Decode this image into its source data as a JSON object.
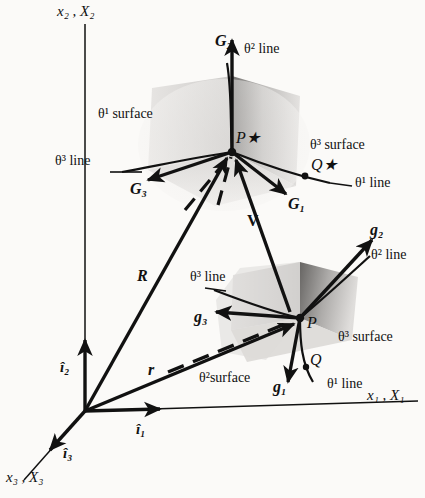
{
  "figure": {
    "background_color": "#fbfaf8",
    "ink_color": "#111111",
    "surface_fill_light": "#dedcda",
    "surface_fill_dark": "#8d8b89"
  },
  "axes": {
    "vertical": {
      "name": "x2-X2-axis",
      "label": "x₂ , X₂"
    },
    "horizontal": {
      "name": "x1-X1-axis",
      "label": "x₁ , X₁"
    },
    "depth": {
      "name": "x3-X3-axis",
      "label": "x₃ , X₃"
    }
  },
  "unit_vectors": [
    {
      "name": "i1-hat",
      "label": "î₁"
    },
    {
      "name": "i2-hat",
      "label": "î₂"
    },
    {
      "name": "i3-hat",
      "label": "î₃"
    }
  ],
  "position_vectors": [
    {
      "name": "R-vector",
      "label": "R",
      "description": "reference position vector to P*"
    },
    {
      "name": "r-vector",
      "label": "r",
      "description": "current position vector to P"
    },
    {
      "name": "V-vector",
      "label": "V",
      "description": "displacement vector from P to P*"
    }
  ],
  "points": [
    {
      "name": "point-P-star",
      "label": "P★"
    },
    {
      "name": "point-Q-star",
      "label": "Q★"
    },
    {
      "name": "point-P",
      "label": "P"
    },
    {
      "name": "point-Q",
      "label": "Q"
    }
  ],
  "reference_config": {
    "basis_vectors": [
      {
        "name": "G1-vector",
        "label": "G₁"
      },
      {
        "name": "G2-vector",
        "label": "G₂"
      },
      {
        "name": "G3-vector",
        "label": "G₃"
      }
    ],
    "coordinate_lines": [
      {
        "name": "theta1-line-upper",
        "label": "θ¹ line"
      },
      {
        "name": "theta2-line-upper",
        "label": "θ² line"
      },
      {
        "name": "theta3-line-upper",
        "label": "θ³ line"
      }
    ],
    "coordinate_surfaces": [
      {
        "name": "theta1-surface-upper",
        "label": "θ¹ surface"
      },
      {
        "name": "theta3-surface-upper",
        "label": "θ³ surface"
      }
    ]
  },
  "current_config": {
    "basis_vectors": [
      {
        "name": "g1-vector",
        "label": "g₁"
      },
      {
        "name": "g2-vector",
        "label": "g₂"
      },
      {
        "name": "g3-vector",
        "label": "g₃"
      }
    ],
    "coordinate_lines": [
      {
        "name": "theta1-line-lower",
        "label": "θ¹ line"
      },
      {
        "name": "theta2-line-lower",
        "label": "θ² line"
      },
      {
        "name": "theta3-line-lower",
        "label": "θ³ line"
      }
    ],
    "coordinate_surfaces": [
      {
        "name": "theta2-surface-lower",
        "label": "θ²surface"
      },
      {
        "name": "theta3-surface-lower",
        "label": "θ³ surface"
      }
    ]
  }
}
